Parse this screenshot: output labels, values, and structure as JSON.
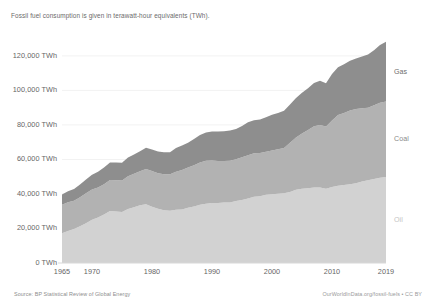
{
  "subtitle": "Fossil fuel consumption is given in terawatt-hour equivalents (TWh).",
  "footer": {
    "source": "Source: BP Statistical Review of Global Energy",
    "credit": "OurWorldInData.org/fossil-fuels • CC BY"
  },
  "axis": {
    "y_ticks": [
      {
        "value": 0,
        "label": "0 TWh"
      },
      {
        "value": 20000,
        "label": "20,000 TWh"
      },
      {
        "value": 40000,
        "label": "40,000 TWh"
      },
      {
        "value": 60000,
        "label": "60,000 TWh"
      },
      {
        "value": 80000,
        "label": "80,000 TWh"
      },
      {
        "value": 100000,
        "label": "100,000 TWh"
      },
      {
        "value": 120000,
        "label": "120,000 TWh"
      }
    ],
    "x_ticks": [
      {
        "value": 1965,
        "label": "1965"
      },
      {
        "value": 1970,
        "label": "1970"
      },
      {
        "value": 1980,
        "label": "1980"
      },
      {
        "value": 1990,
        "label": "1990"
      },
      {
        "value": 2000,
        "label": "2000"
      },
      {
        "value": 2010,
        "label": "2010"
      },
      {
        "value": 2019,
        "label": "2019"
      }
    ]
  },
  "series_labels": {
    "gas": "Gas",
    "coal": "Coal",
    "oil": "Oil"
  },
  "colors": {
    "gas": "#8e8e8e",
    "coal": "#b2b2b2",
    "oil": "#d2d2d2",
    "gridline": "#f2f2f2",
    "axis_text": "#666666",
    "gas_label": "#6e6e6e",
    "coal_label": "#8a8a8a",
    "oil_label": "#c4c4c4"
  },
  "chart_data": {
    "type": "area",
    "stacked": true,
    "title": "",
    "subtitle": "Fossil fuel consumption is given in terawatt-hour equivalents (TWh).",
    "xlabel": "",
    "ylabel": "",
    "xlim": [
      1965,
      2019
    ],
    "ylim": [
      0,
      135000
    ],
    "grid": "horizontal",
    "legend": "right-inline-labels",
    "x": [
      1965,
      1966,
      1967,
      1968,
      1969,
      1970,
      1971,
      1972,
      1973,
      1974,
      1975,
      1976,
      1977,
      1978,
      1979,
      1980,
      1981,
      1982,
      1983,
      1984,
      1985,
      1986,
      1987,
      1988,
      1989,
      1990,
      1991,
      1992,
      1993,
      1994,
      1995,
      1996,
      1997,
      1998,
      1999,
      2000,
      2001,
      2002,
      2003,
      2004,
      2005,
      2006,
      2007,
      2008,
      2009,
      2010,
      2011,
      2012,
      2013,
      2014,
      2015,
      2016,
      2017,
      2018,
      2019
    ],
    "series": [
      {
        "name": "Oil",
        "color": "#d2d2d2",
        "values": [
          17200,
          18500,
          19700,
          21300,
          23100,
          25100,
          26400,
          28100,
          30200,
          29900,
          29500,
          31300,
          32300,
          33400,
          34000,
          32600,
          31400,
          30600,
          30300,
          30900,
          31000,
          32000,
          32700,
          33700,
          34300,
          34700,
          34800,
          35100,
          35100,
          35900,
          36500,
          37400,
          38400,
          38700,
          39500,
          39800,
          40100,
          40400,
          41200,
          42500,
          43000,
          43300,
          43800,
          43700,
          43000,
          44100,
          44700,
          45200,
          45700,
          46200,
          47200,
          47900,
          48600,
          49400,
          49800
        ]
      },
      {
        "name": "Coal",
        "color": "#b2b2b2",
        "values": [
          16500,
          16700,
          16400,
          16800,
          17300,
          17500,
          17300,
          17500,
          17900,
          18000,
          18300,
          18900,
          19400,
          19700,
          20500,
          20700,
          20600,
          20800,
          21100,
          22000,
          22900,
          23300,
          24000,
          24600,
          24900,
          24700,
          24300,
          24000,
          24100,
          24200,
          24700,
          25000,
          25200,
          25000,
          25000,
          25400,
          25800,
          26200,
          28500,
          30200,
          32000,
          33700,
          35400,
          36300,
          36100,
          38400,
          41000,
          41700,
          42600,
          43000,
          42500,
          42100,
          42800,
          43500,
          43800
        ]
      },
      {
        "name": "Gas",
        "color": "#8e8e8e",
        "values": [
          6000,
          6400,
          6800,
          7400,
          8000,
          8600,
          9200,
          9700,
          10100,
          10300,
          10300,
          10900,
          11100,
          11600,
          12300,
          12500,
          12600,
          12700,
          12800,
          13700,
          14200,
          14400,
          15100,
          15800,
          16400,
          16800,
          17100,
          17200,
          17500,
          17600,
          18200,
          19100,
          19100,
          19400,
          19900,
          20700,
          21000,
          21600,
          22100,
          22900,
          23600,
          24200,
          25100,
          25600,
          25100,
          27000,
          27700,
          28300,
          28900,
          29300,
          29900,
          30800,
          31900,
          33400,
          34600
        ]
      }
    ]
  }
}
